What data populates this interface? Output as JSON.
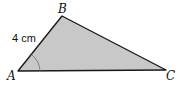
{
  "diagram": {
    "type": "triangle",
    "vertices": {
      "A": {
        "label": "A",
        "x": 18,
        "y": 71
      },
      "B": {
        "label": "B",
        "x": 62,
        "y": 16
      },
      "C": {
        "label": "C",
        "x": 166,
        "y": 70
      }
    },
    "side_label": {
      "side": "AB",
      "text": "4 cm"
    },
    "angle_mark": {
      "vertex": "A"
    },
    "colors": {
      "fill": "#c8c8c8",
      "stroke": "#1a1a1a"
    }
  }
}
